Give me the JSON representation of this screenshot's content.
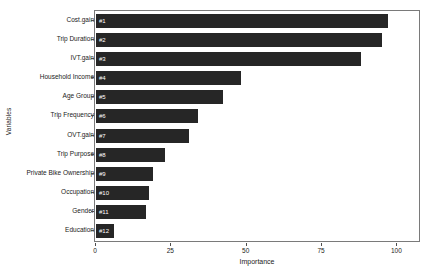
{
  "chart_data": {
    "type": "bar",
    "orientation": "horizontal",
    "title": "",
    "xlabel": "Importance",
    "ylabel": "Variables",
    "xlim": [
      0,
      107.5
    ],
    "ylim": [
      0,
      12
    ],
    "grid": false,
    "legend": false,
    "bar_color": "#262626",
    "panel_border_color": "#7a7a7a",
    "xticks": [
      0,
      25,
      50,
      75,
      100
    ],
    "xtick_labels": [
      "0",
      "25",
      "50",
      "75",
      "100"
    ],
    "categories": [
      "Cost.gain",
      "Trip Duration",
      "IVT.gain",
      "Household Income",
      "Age Group",
      "Trip Frequency",
      "OVT.gain",
      "Trip Purpose",
      "Private Bike Ownership",
      "Occupation",
      "Gender",
      "Education"
    ],
    "values": [
      97,
      95,
      88,
      48,
      42,
      34,
      31,
      23,
      19,
      17.5,
      16.5,
      6
    ],
    "bar_labels": [
      "#1",
      "#2",
      "#3",
      "#4",
      "#5",
      "#6",
      "#7",
      "#8",
      "#9",
      "#10",
      "#11",
      "#12"
    ]
  }
}
